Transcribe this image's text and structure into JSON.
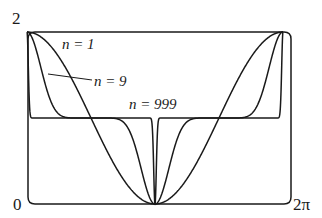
{
  "chart_data": {
    "type": "line",
    "title": "",
    "xlabel": "",
    "ylabel": "",
    "function_description": "f_n(x) = 1 + cos^n(x)",
    "xlim": [
      0,
      6.2832
    ],
    "ylim": [
      0,
      2
    ],
    "x_tick_labels": [
      "0",
      "2π"
    ],
    "y_tick_labels": [
      "0",
      "2"
    ],
    "grid": false,
    "legend": "inline labels",
    "series": [
      {
        "name": "n = 1",
        "n": 1,
        "x": [
          0,
          0.785,
          1.571,
          2.356,
          3.1416,
          3.927,
          4.712,
          5.498,
          6.2832
        ],
        "values": [
          2,
          1.707,
          1,
          0.293,
          0,
          0.293,
          1,
          1.707,
          2
        ]
      },
      {
        "name": "n = 9",
        "n": 9,
        "x": [
          0,
          0.3,
          0.6,
          0.785,
          1.0,
          1.571,
          2.14,
          2.356,
          2.54,
          2.84,
          3.1416,
          3.44,
          3.74,
          3.927,
          4.14,
          4.712,
          5.28,
          5.498,
          5.68,
          5.98,
          6.2832
        ],
        "values": [
          2,
          1.667,
          1.132,
          1.044,
          1.008,
          1,
          0.992,
          0.956,
          0.868,
          0.333,
          0,
          0.333,
          0.868,
          0.956,
          0.992,
          1,
          1.008,
          1.044,
          1.132,
          1.667,
          2
        ]
      },
      {
        "name": "n = 999",
        "n": 999,
        "x": [
          0,
          0.05,
          0.15,
          1.571,
          2.99,
          3.09,
          3.1416,
          3.19,
          3.29,
          4.712,
          6.13,
          6.23,
          6.2832
        ],
        "values": [
          2,
          1.29,
          1,
          1,
          1,
          0.29,
          0,
          0.29,
          1,
          1,
          1,
          1.29,
          2
        ]
      }
    ],
    "annotations": [
      {
        "text": "n = 1",
        "near": "upper-left, right of n=1 curve"
      },
      {
        "text": "n = 9",
        "near": "left, with leader line to n=9 curve"
      },
      {
        "text": "n = 999",
        "near": "center, above plateau at y=1"
      }
    ]
  },
  "labels": {
    "y_top": "2",
    "y_bottom": "0",
    "x_right": "2π",
    "series_n1": "n = 1",
    "series_n9": "n = 9",
    "series_n999": "n = 999"
  }
}
